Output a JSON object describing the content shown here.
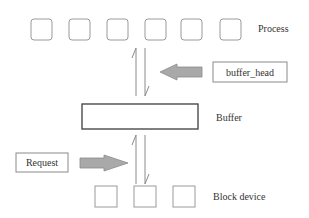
{
  "diagram": {
    "process": {
      "label": "Process",
      "box_count": 6,
      "boxes": [
        {
          "x": 31,
          "y": 19
        },
        {
          "x": 69,
          "y": 19
        },
        {
          "x": 107,
          "y": 19
        },
        {
          "x": 145,
          "y": 19
        },
        {
          "x": 181,
          "y": 19
        },
        {
          "x": 220,
          "y": 19
        }
      ]
    },
    "buffer_head": {
      "label": "buffer_head",
      "arrow_direction": "left"
    },
    "buffer": {
      "label": "Buffer"
    },
    "request": {
      "label": "Request",
      "arrow_direction": "right"
    },
    "block_device": {
      "label": "Block device",
      "box_count": 3,
      "boxes": [
        {
          "x": 95,
          "y": 186
        },
        {
          "x": 134,
          "y": 186
        },
        {
          "x": 173,
          "y": 186
        }
      ]
    },
    "flows": [
      {
        "from": "Buffer",
        "to": "Process",
        "direction": "up"
      },
      {
        "from": "Process",
        "to": "Buffer",
        "direction": "down"
      },
      {
        "from": "Block device",
        "to": "Buffer",
        "direction": "up"
      },
      {
        "from": "Buffer",
        "to": "Block device",
        "direction": "down"
      }
    ],
    "colors": {
      "box_stroke": "#9a9a9a",
      "buffer_stroke": "#4a4a4a",
      "arrow_fill": "#a9a9a9",
      "text": "#333333"
    }
  }
}
